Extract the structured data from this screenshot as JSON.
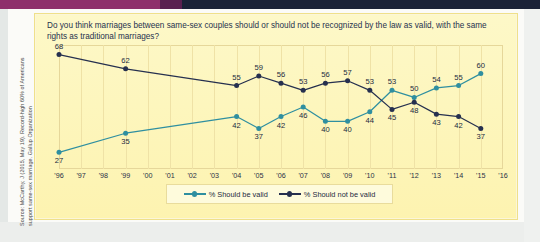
{
  "source_credit": {
    "line1": "Source: McCarthy, J (2015, May 19). Record-high 60% of Americans",
    "line2": "support same-sex marriage. Gallup Organization"
  },
  "colors": {
    "valid": "#2f8fa0",
    "not_valid": "#26304f",
    "panel": "#fdf6bd",
    "grid": "#efe2a6",
    "top_band": "#1b2237",
    "top_band_accent": "#8e2f6b"
  },
  "chart_data": {
    "type": "line",
    "title": "Do you think marriages between same-sex couples should or should not be recognized by the law as valid, with the same rights as traditional marriages?",
    "xlabel": "",
    "ylabel": "",
    "ylim": [
      20,
      72
    ],
    "grid": true,
    "legend_position": "bottom-center",
    "x": [
      "'96",
      "'97",
      "'98",
      "'99",
      "'00",
      "'01",
      "'02",
      "'03",
      "'04",
      "'05",
      "'06",
      "'07",
      "'08",
      "'09",
      "'10",
      "'11",
      "'12",
      "'13",
      "'14",
      "'15",
      "'16"
    ],
    "tick_labels": [
      "'96",
      "'97",
      "'98",
      "'99",
      "'00",
      "'01",
      "'02",
      "'03",
      "'04",
      "'05",
      "'06",
      "'07",
      "'08",
      "'09",
      "'10",
      "'11",
      "'12",
      "'13",
      "'14",
      "'15",
      "'16"
    ],
    "series": [
      {
        "name": "% Should be valid",
        "color": "#2f8fa0",
        "points": [
          {
            "x": "'96",
            "y": 27,
            "label": "27",
            "label_pos": "below"
          },
          {
            "x": "'99",
            "y": 35,
            "label": "35",
            "label_pos": "below"
          },
          {
            "x": "'04",
            "y": 42,
            "label": "42",
            "label_pos": "below"
          },
          {
            "x": "'05",
            "y": 37,
            "label": "37",
            "label_pos": "below"
          },
          {
            "x": "'06",
            "y": 42,
            "label": "42",
            "label_pos": "below"
          },
          {
            "x": "'07",
            "y": 46,
            "label": "46",
            "label_pos": "below"
          },
          {
            "x": "'08",
            "y": 40,
            "label": "40",
            "label_pos": "below"
          },
          {
            "x": "'09",
            "y": 40,
            "label": "40",
            "label_pos": "below"
          },
          {
            "x": "'10",
            "y": 44,
            "label": "44",
            "label_pos": "below"
          },
          {
            "x": "'11",
            "y": 53,
            "label": "53",
            "label_pos": "above"
          },
          {
            "x": "'12",
            "y": 50,
            "label": "50",
            "label_pos": "above"
          },
          {
            "x": "'13",
            "y": 54,
            "label": "54",
            "label_pos": "above"
          },
          {
            "x": "'14",
            "y": 55,
            "label": "55",
            "label_pos": "above"
          },
          {
            "x": "'15",
            "y": 60,
            "label": "60",
            "label_pos": "above"
          }
        ]
      },
      {
        "name": "% Should not be valid",
        "color": "#26304f",
        "points": [
          {
            "x": "'96",
            "y": 68,
            "label": "68",
            "label_pos": "above"
          },
          {
            "x": "'99",
            "y": 62,
            "label": "62",
            "label_pos": "above"
          },
          {
            "x": "'04",
            "y": 55,
            "label": "55",
            "label_pos": "above"
          },
          {
            "x": "'05",
            "y": 59,
            "label": "59",
            "label_pos": "above"
          },
          {
            "x": "'06",
            "y": 56,
            "label": "56",
            "label_pos": "above"
          },
          {
            "x": "'07",
            "y": 53,
            "label": "53",
            "label_pos": "above"
          },
          {
            "x": "'08",
            "y": 56,
            "label": "56",
            "label_pos": "above"
          },
          {
            "x": "'09",
            "y": 57,
            "label": "57",
            "label_pos": "above"
          },
          {
            "x": "'10",
            "y": 53,
            "label": "53",
            "label_pos": "above"
          },
          {
            "x": "'11",
            "y": 45,
            "label": "45",
            "label_pos": "below"
          },
          {
            "x": "'12",
            "y": 48,
            "label": "48",
            "label_pos": "below"
          },
          {
            "x": "'13",
            "y": 43,
            "label": "43",
            "label_pos": "below"
          },
          {
            "x": "'14",
            "y": 42,
            "label": "42",
            "label_pos": "below"
          },
          {
            "x": "'15",
            "y": 37,
            "label": "37",
            "label_pos": "below"
          }
        ]
      }
    ],
    "legend": [
      {
        "label": "% Should be valid",
        "color": "#2f8fa0"
      },
      {
        "label": "% Should not be valid",
        "color": "#26304f"
      }
    ]
  }
}
